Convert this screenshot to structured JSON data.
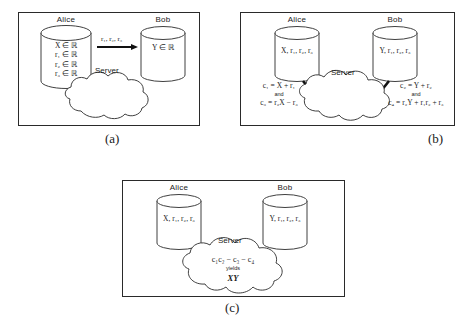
{
  "figure": {
    "background": "#ffffff",
    "stroke": "#2a2a2a"
  },
  "panels": [
    {
      "id": "a",
      "caption": "(a)",
      "alice": {
        "name": "Alice",
        "contents": [
          "X ∈ ℝ",
          "r₁ ∈ ℝ",
          "r₂ ∈ ℝ",
          "r₃ ∈ ℝ"
        ]
      },
      "bob": {
        "name": "Bob",
        "contents": [
          "Y ∈ ℝ"
        ]
      },
      "arrow_label": "r₁, r₂, r₃",
      "server_label": "Server"
    },
    {
      "id": "b",
      "caption": "(b)",
      "alice": {
        "name": "Alice",
        "contents": [
          "X, r₁, r₂, r₃"
        ]
      },
      "bob": {
        "name": "Bob",
        "contents": [
          "Y, r₁, r₂, r₃"
        ]
      },
      "server_label": "Server",
      "left_equation": {
        "first": "c₁ = X + r₁",
        "connector": "and",
        "second": "c₃ = r₂X − r₃"
      },
      "right_equation": {
        "first": "c₂ = Y + r₂",
        "connector": "and",
        "second": "c₄ = r₂Y + r₁r₂ + r₃"
      }
    },
    {
      "id": "c",
      "caption": "(c)",
      "alice": {
        "name": "Alice",
        "contents": [
          "X, r₁, r₂, r₃"
        ]
      },
      "bob": {
        "name": "Bob",
        "contents": [
          "Y, r₁, r₂, r₃"
        ]
      },
      "server_label": "Server",
      "cloud_equation": {
        "expression": "c₁c₂ − c₃ − c₄",
        "connector": "yields",
        "result": "XY"
      }
    }
  ]
}
